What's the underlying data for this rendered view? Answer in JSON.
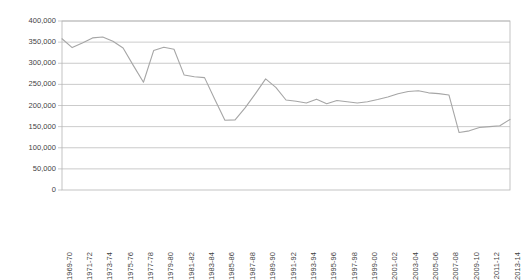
{
  "chart_data": {
    "type": "line",
    "title": "",
    "subtitle": "",
    "xlabel": "",
    "ylabel": "",
    "legend": [],
    "legend_position": "none",
    "grid": true,
    "grid_axis": "y",
    "ylim": [
      0,
      400000
    ],
    "yticks": [
      0,
      50000,
      100000,
      150000,
      200000,
      250000,
      300000,
      350000,
      400000
    ],
    "ytick_labels": [
      "0",
      "50,000",
      "100,000",
      "150,000",
      "200,000",
      "250,000",
      "300,000",
      "350,000",
      "400,000"
    ],
    "xtick_label_rotation": 90,
    "xtick_label_interval": 2,
    "series_color": "#a6a6a6",
    "grid_color": "#b5b5b5",
    "axis_color": "#b5b5b5",
    "text_color": "#3f3f3f",
    "categories": [
      "1969-70",
      "1970-71",
      "1971-72",
      "1972-73",
      "1973-74",
      "1974-75",
      "1975-76",
      "1976-77",
      "1977-78",
      "1978-79",
      "1979-80",
      "1980-81",
      "1981-82",
      "1982-83",
      "1983-84",
      "1984-85",
      "1985-86",
      "1986-87",
      "1987-88",
      "1988-89",
      "1989-90",
      "1990-91",
      "1991-92",
      "1992-93",
      "1993-94",
      "1994-95",
      "1995-96",
      "1996-97",
      "1997-98",
      "1998-99",
      "1999-00",
      "2000-01",
      "2001-02",
      "2002-03",
      "2003-04",
      "2004-05",
      "2005-06",
      "2006-07",
      "2007-08",
      "2008-09",
      "2009-10",
      "2010-11",
      "2011-12",
      "2012-13",
      "2013-14"
    ],
    "labeled_categories": [
      "1969-70",
      "1971-72",
      "1973-74",
      "1975-76",
      "1977-78",
      "1979-80",
      "1981-82",
      "1983-84",
      "1985-86",
      "1987-88",
      "1989-90",
      "1991-92",
      "1993-94",
      "1995-96",
      "1997-98",
      "1999-00",
      "2001-02",
      "2003-04",
      "2005-06",
      "2007-08",
      "2009-10",
      "2011-12",
      "2013-14"
    ],
    "values": [
      358000,
      337000,
      348000,
      360000,
      362000,
      352000,
      336000,
      295000,
      255000,
      330000,
      338000,
      333000,
      272000,
      268000,
      266000,
      215000,
      165000,
      166000,
      195000,
      228000,
      263000,
      243000,
      213000,
      210000,
      206000,
      215000,
      204000,
      212000,
      209000,
      206000,
      209000,
      214000,
      220000,
      228000,
      233000,
      235000,
      230000,
      228000,
      225000,
      136000,
      140000,
      148000,
      150000,
      152000,
      167000
    ]
  }
}
